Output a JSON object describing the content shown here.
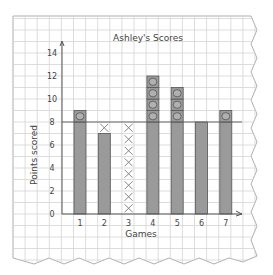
{
  "chart_data": {
    "type": "bar",
    "title": "Ashley's Scores",
    "xlabel": "Games",
    "ylabel": "Points scored",
    "categories": [
      "1",
      "2",
      "3",
      "4",
      "5",
      "6",
      "7"
    ],
    "values": [
      9,
      7,
      0,
      12,
      11,
      8,
      9
    ],
    "ylim": [
      0,
      14
    ],
    "yticks": [
      0,
      2,
      4,
      6,
      8,
      10,
      12,
      14
    ],
    "grid": true,
    "legend": null,
    "mean_line": 8,
    "annotations": {
      "description": "Bars leveled to the mean of 8: circles mark points above 8, X marks show points missing below 8",
      "circles_above_mean": [
        1,
        0,
        0,
        4,
        3,
        0,
        1
      ],
      "x_marks_below_mean": [
        0,
        1,
        8,
        0,
        0,
        0,
        0
      ]
    },
    "colors": {
      "bar": "#9a9a9a",
      "grid": "#d4d4d4",
      "axis": "#555555",
      "mean_line": "#666666"
    }
  }
}
